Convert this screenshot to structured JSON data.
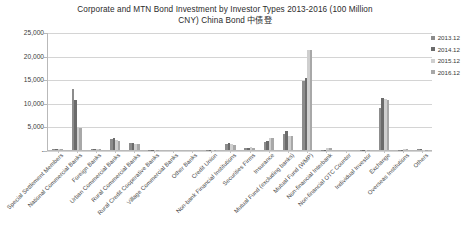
{
  "chart_data": {
    "type": "bar",
    "title": "Corporate and MTN Bond Investment by Investor Types 2013-2016  (100 Million CNY) China Bond  中债登",
    "title_line1": "Corporate and MTN Bond Investment by Investor Types 2013-2016  (100 Million",
    "title_line2": "CNY) China Bond  中债登",
    "xlabel": "",
    "ylabel": "",
    "ylim": [
      0,
      25000
    ],
    "yticks": [
      0,
      5000,
      10000,
      15000,
      20000,
      25000
    ],
    "ytick_labels": [
      "-",
      "5,000",
      "10,000",
      "15,000",
      "20,000",
      "25,000"
    ],
    "grid": true,
    "legend_position": "right",
    "categories": [
      "Special Settlement Members",
      "National Commercial Banks",
      "Foreign Banks",
      "Urban Commercial Banks",
      "Rural Commercial Banks",
      "Rural Credit Cooperative Banks",
      "Village Commercial Banks",
      "Other Banks",
      "Credit Union",
      "Non-bank Financial Institutions",
      "Securities Firms",
      "Insurance",
      "Mutual Fund (excluding banks)",
      "Mutual Fund (WMP)",
      "Non-financial Interbank",
      "Non-financial OTC Counter",
      "Individual Investor",
      "Exchange",
      "Overseas Institutions",
      "Others"
    ],
    "series": [
      {
        "name": "2013.12",
        "color": "#8c8c8c",
        "values": [
          120,
          12900,
          250,
          2350,
          1420,
          80,
          10,
          0,
          30,
          1350,
          330,
          1650,
          3300,
          14600,
          40,
          10,
          20,
          8900,
          60,
          120
        ]
      },
      {
        "name": "2014.12",
        "color": "#6b6b6b",
        "values": [
          150,
          10500,
          260,
          2600,
          1500,
          95,
          15,
          0,
          40,
          1400,
          420,
          1900,
          3950,
          15200,
          45,
          10,
          25,
          11000,
          70,
          110
        ]
      },
      {
        "name": "2015.12",
        "color": "#cfcfcf",
        "values": [
          140,
          4800,
          230,
          2100,
          1350,
          90,
          15,
          0,
          35,
          1200,
          560,
          2650,
          3050,
          21200,
          430,
          10,
          20,
          10800,
          230,
          90
        ]
      },
      {
        "name": "2016.12",
        "color": "#a8a8a8",
        "values": [
          130,
          4750,
          240,
          1950,
          1300,
          85,
          10,
          0,
          30,
          1150,
          520,
          2600,
          2900,
          21100,
          400,
          10,
          20,
          10700,
          210,
          80
        ]
      }
    ]
  },
  "legend": {
    "items": [
      {
        "label": "2013.12",
        "color": "#8c8c8c"
      },
      {
        "label": "2014.12",
        "color": "#6b6b6b"
      },
      {
        "label": "2015.12",
        "color": "#cfcfcf"
      },
      {
        "label": "2016.12",
        "color": "#a8a8a8"
      }
    ]
  }
}
